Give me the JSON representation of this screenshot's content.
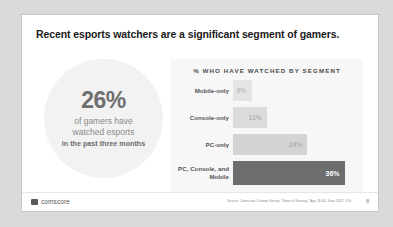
{
  "slide": {
    "title": "Recent esports watchers are a significant segment of gamers."
  },
  "stat": {
    "value": "26%",
    "line1": "of gamers have",
    "line2": "watched esports",
    "line3": "in the past three months"
  },
  "chart_data": {
    "type": "bar",
    "title": "% WHO HAVE WATCHED BY SEGMENT",
    "orientation": "horizontal",
    "categories": [
      "Mobile-only",
      "Console-only",
      "PC-only",
      "PC, Console, and Mobile"
    ],
    "values": [
      6,
      11,
      24,
      36
    ],
    "value_labels": [
      "6%",
      "11%",
      "24%",
      "36%"
    ],
    "xlabel": "",
    "ylabel": "",
    "xlim": [
      0,
      40
    ],
    "grid": false,
    "legend": "none",
    "bar_colors": [
      "#e4e4e4",
      "#dcdcdc",
      "#d4d4d4",
      "#6d6d6d"
    ],
    "value_text_colors": [
      "#bdbdbd",
      "#b4b4b4",
      "#b0b0b0",
      "#ffffff"
    ]
  },
  "footer": {
    "logo_text": "comscore",
    "logo_icon": "square-mark-icon",
    "source": "Source: Comscore Custom Survey, \"State of Gaming,\" Age 18-64, June 2021, U.S.",
    "page_number": "8"
  }
}
